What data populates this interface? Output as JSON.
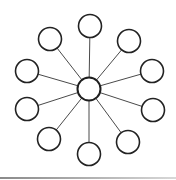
{
  "diagram": {
    "type": "hub-and-spoke",
    "hub": {
      "id": "hub",
      "cx": 89,
      "cy": 89,
      "r": 11.5
    },
    "nodes": [
      {
        "id": "node-top",
        "cx": 90,
        "cy": 26,
        "r": 11.5
      },
      {
        "id": "node-upper-right",
        "cx": 129,
        "cy": 41,
        "r": 11.5
      },
      {
        "id": "node-right-upper",
        "cx": 152,
        "cy": 71,
        "r": 11.5
      },
      {
        "id": "node-right-lower",
        "cx": 153,
        "cy": 110,
        "r": 11.5
      },
      {
        "id": "node-lower-right",
        "cx": 128,
        "cy": 142,
        "r": 11.5
      },
      {
        "id": "node-bottom",
        "cx": 89,
        "cy": 154,
        "r": 11.5
      },
      {
        "id": "node-lower-left",
        "cx": 49,
        "cy": 139,
        "r": 11.5
      },
      {
        "id": "node-left-lower",
        "cx": 27,
        "cy": 109,
        "r": 11.5
      },
      {
        "id": "node-left-upper",
        "cx": 27,
        "cy": 71,
        "r": 11.5
      },
      {
        "id": "node-upper-left",
        "cx": 50,
        "cy": 39,
        "r": 11.5
      }
    ],
    "node_count": 10,
    "colors": {
      "edge": "#4a4a4a",
      "node_stroke": "#222222",
      "node_fill": "#ffffff",
      "background": "#ffffff"
    }
  }
}
